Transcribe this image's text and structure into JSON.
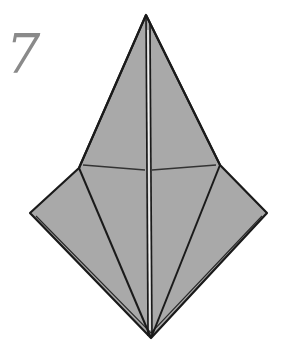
{
  "step": {
    "number": "7"
  },
  "diagram": {
    "fill_color": "#a9a9a9",
    "line_color": "#1a1a1a",
    "background": "#ffffff",
    "vertices": {
      "top": [
        146,
        15
      ],
      "left": [
        30,
        213
      ],
      "right": [
        267,
        213
      ],
      "left_shoulder": [
        79,
        168
      ],
      "right_shoulder": [
        220,
        165
      ],
      "bottom": [
        151,
        338
      ]
    }
  }
}
